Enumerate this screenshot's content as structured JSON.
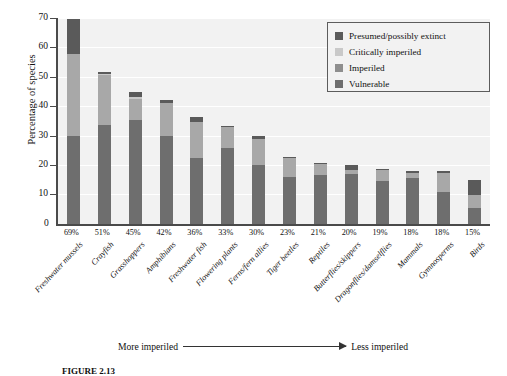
{
  "chart_data": {
    "type": "bar",
    "stacked": true,
    "title": "",
    "xlabel": "",
    "ylabel": "Percentage of species",
    "ylim": [
      0,
      70
    ],
    "yticks": [
      10,
      20,
      30,
      40,
      50,
      60,
      70
    ],
    "grid": true,
    "legend_position": "top-right",
    "categories": [
      "Freshwater mussels",
      "Crayfish",
      "Grasshoppers",
      "Amphibians",
      "Freshwater fish",
      "Flowering plants",
      "Ferns/fern allies",
      "Tiger beetles",
      "Reptiles",
      "Butterflies/skippers",
      "Dragonflies/damselflies",
      "Mammals",
      "Gymnosperms",
      "Birds"
    ],
    "category_percent_labels": [
      "69%",
      "51%",
      "45%",
      "42%",
      "36%",
      "33%",
      "30%",
      "23%",
      "21%",
      "20%",
      "19%",
      "18%",
      "18%",
      "15%"
    ],
    "series": [
      {
        "name": "Vulnerable",
        "color": "#6e6e6e",
        "values": [
          30.0,
          33.5,
          35.5,
          30.0,
          22.5,
          26.0,
          20.0,
          16.0,
          16.5,
          17.0,
          14.5,
          15.5,
          11.0,
          5.5
        ]
      },
      {
        "name": "Imperiled",
        "color": "#a8a8a8",
        "values": [
          27.8,
          17.0,
          7.0,
          11.0,
          12.0,
          7.0,
          9.0,
          6.5,
          4.0,
          1.5,
          4.0,
          2.0,
          6.5,
          4.5
        ]
      },
      {
        "name": "Critically imperiled",
        "color": "#c9c9c9",
        "values": [
          0.0,
          0.5,
          0.5,
          0.0,
          0.0,
          0.0,
          0.0,
          0.0,
          0.0,
          0.0,
          0.0,
          0.0,
          0.0,
          0.0
        ]
      },
      {
        "name": "Presumed/possibly extinct",
        "color": "#5a5a5a",
        "values": [
          11.8,
          0.7,
          1.8,
          1.0,
          1.7,
          0.2,
          0.8,
          0.3,
          0.2,
          1.5,
          0.2,
          0.5,
          0.5,
          5.0
        ]
      }
    ],
    "totals": [
      69.6,
      51.7,
      44.8,
      42.0,
      36.2,
      33.2,
      29.8,
      22.8,
      20.7,
      20.0,
      18.7,
      18.0,
      18.0,
      15.0
    ],
    "annotations": {
      "left_arrow_label": "More imperiled",
      "right_arrow_label": "Less imperiled"
    }
  },
  "legend": {
    "items": [
      {
        "label": "Presumed/possibly extinct",
        "color": "#5a5a5a"
      },
      {
        "label": "Critically imperiled",
        "color": "#c9c9c9"
      },
      {
        "label": "Imperiled",
        "color": "#8e8e8e"
      },
      {
        "label": "Vulnerable",
        "color": "#6e6e6e"
      }
    ]
  },
  "axis": {
    "zero_label": "0"
  },
  "caption": {
    "number": "FIGURE 2.13",
    "text": ""
  },
  "colors": {
    "plot_background": "#f2f2f2",
    "gridline": "#ffffff",
    "axis": "#4a4a4a",
    "text": "#111111"
  }
}
